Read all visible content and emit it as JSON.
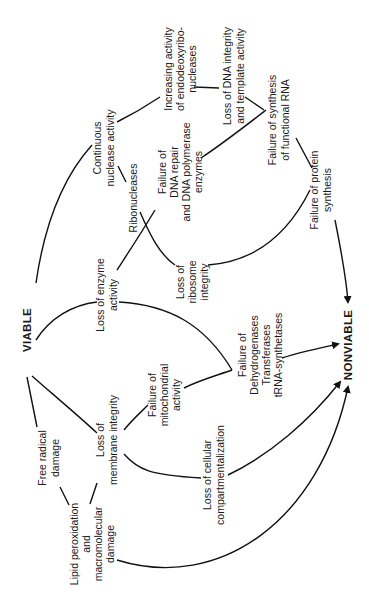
{
  "diagram": {
    "orientation": "rotated 90 degrees counterclockwise",
    "nodes": {
      "viable": "VIABLE",
      "nonviable": "NONVIABLE",
      "free_radical": [
        "Free radical",
        "damage"
      ],
      "lipid": [
        "Lipid peroxidation",
        "and",
        "macromolecular",
        "damage"
      ],
      "membrane": [
        "Loss of",
        "membrane integrity"
      ],
      "compartment": [
        "Loss of cellular",
        "compartmentalization"
      ],
      "mito": [
        "Failure of",
        "mitochondrial",
        "activity"
      ],
      "enzymes_fail": [
        "Failure of",
        "Dehydrogenases",
        "Transferases",
        "tRNA-synthetases"
      ],
      "enzyme_loss": [
        "Loss of enzyme",
        "activity"
      ],
      "ribosome": [
        "Loss of",
        "ribosome",
        "integrity"
      ],
      "ribonucleases": [
        "Ribonucleases"
      ],
      "continuous": [
        "Continuous",
        "nuclease activity"
      ],
      "dna_repair": [
        "Failure of",
        "DNA repair",
        "and DNA polymerase",
        "enzymes"
      ],
      "endo": [
        "Increasing activity",
        "of endodeoxyribo-",
        "nucleases"
      ],
      "dna_integrity": [
        "Loss of DNA integrity",
        "and template activity"
      ],
      "rna_fail": [
        "Failure of synthesis",
        "of functional RNA"
      ],
      "protein_fail": [
        "Failure of protein",
        "synthesis"
      ]
    }
  }
}
